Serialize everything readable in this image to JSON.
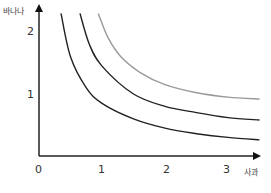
{
  "chart_data": {
    "type": "line",
    "title": "",
    "xlabel": "사과",
    "ylabel": "바나나",
    "xlim": [
      0,
      3.5
    ],
    "ylim": [
      0,
      2.4
    ],
    "x_ticks": [
      "0",
      "1",
      "2",
      "3"
    ],
    "y_ticks": [
      "1",
      "2"
    ],
    "grid": false,
    "legend": null,
    "series": [
      {
        "name": "indifference-curve-1",
        "color": "#222222",
        "points": [
          [
            0.35,
            2.3
          ],
          [
            0.5,
            1.6
          ],
          [
            0.75,
            1.1
          ],
          [
            1.0,
            0.85
          ],
          [
            1.5,
            0.6
          ],
          [
            2.0,
            0.45
          ],
          [
            2.5,
            0.36
          ],
          [
            3.0,
            0.3
          ],
          [
            3.5,
            0.26
          ]
        ]
      },
      {
        "name": "indifference-curve-2",
        "color": "#222222",
        "points": [
          [
            0.65,
            2.3
          ],
          [
            0.8,
            1.8
          ],
          [
            1.0,
            1.45
          ],
          [
            1.5,
            1.0
          ],
          [
            2.0,
            0.8
          ],
          [
            2.5,
            0.7
          ],
          [
            3.0,
            0.62
          ],
          [
            3.5,
            0.58
          ]
        ]
      },
      {
        "name": "indifference-curve-3",
        "color": "#999999",
        "points": [
          [
            0.94,
            2.3
          ],
          [
            1.1,
            1.9
          ],
          [
            1.3,
            1.6
          ],
          [
            1.6,
            1.35
          ],
          [
            2.0,
            1.15
          ],
          [
            2.5,
            1.02
          ],
          [
            3.0,
            0.95
          ],
          [
            3.5,
            0.92
          ]
        ]
      }
    ]
  },
  "labels": {
    "x_axis_title": "사과",
    "y_axis_title": "바나나",
    "origin": "0",
    "x_tick_1": "1",
    "x_tick_2": "2",
    "x_tick_3": "3",
    "y_tick_1": "1",
    "y_tick_2": "2"
  }
}
